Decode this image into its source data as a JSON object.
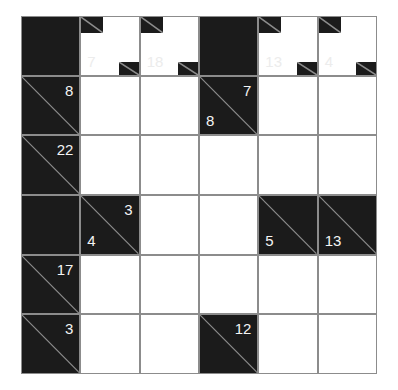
{
  "puzzle": {
    "type": "kakuro",
    "rows": 6,
    "cols": 6,
    "colors": {
      "block": "#1b1b1b",
      "grid_line": "#8c8c8c",
      "empty": "#ffffff",
      "clue_text": "#f4f4f4",
      "faded_clue_text": "#ececec"
    },
    "top_clues": {
      "c1": "7",
      "c2": "18",
      "c4": "13",
      "c5": "4"
    },
    "row1": {
      "c0_across": "8",
      "c3_down": "8",
      "c3_across": "7"
    },
    "row2": {
      "c0_across": "22"
    },
    "row3": {
      "c1_down": "4",
      "c1_across": "3",
      "c4_down": "5",
      "c5_down": "13"
    },
    "row4": {
      "c0_across": "17"
    },
    "row5": {
      "c0_across": "3",
      "c3_across": "12"
    }
  }
}
